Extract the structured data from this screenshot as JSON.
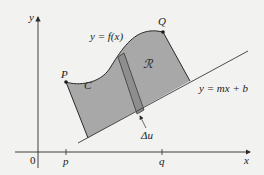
{
  "diagram": {
    "axes": {
      "x_label": "x",
      "y_label": "y",
      "origin_label": "0",
      "x_ticks": [
        {
          "label": "p"
        },
        {
          "label": "q"
        }
      ]
    },
    "points": {
      "P": "P",
      "Q": "Q"
    },
    "curve_label": "C",
    "function_label": "y = f(x)",
    "line_label": "y = mx + b",
    "region_label": "ℛ",
    "strip_label": "Δu",
    "colors": {
      "background": "#f2f2f0",
      "region_fill": "#a8a8a8",
      "strip_fill": "#8e8e8e",
      "stroke": "#2a2a2a",
      "line": "#3a3a3a"
    }
  }
}
